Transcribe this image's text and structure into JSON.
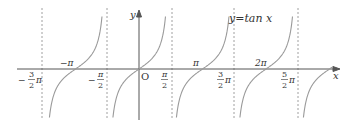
{
  "chart_data": {
    "type": "line",
    "title": "y=tan x",
    "function": "y = tan x",
    "xlabel": "x",
    "ylabel": "y",
    "origin_label": "O",
    "x_range_pi": [
      -2.0,
      3.0
    ],
    "asymptotes_pi": [
      -1.5,
      -0.5,
      0.5,
      1.5,
      2.5
    ],
    "zeros_pi": [
      -1,
      0,
      1,
      2,
      3
    ],
    "tick_labels": [
      {
        "value_pi": -1.5,
        "label": "-3/2 π"
      },
      {
        "value_pi": -1,
        "label": "-π"
      },
      {
        "value_pi": -0.5,
        "label": "-π/2"
      },
      {
        "value_pi": 0.5,
        "label": "π/2"
      },
      {
        "value_pi": 1,
        "label": "π"
      },
      {
        "value_pi": 1.5,
        "label": "3/2 π"
      },
      {
        "value_pi": 2,
        "label": "2π"
      },
      {
        "value_pi": 2.5,
        "label": "5/2 π"
      }
    ],
    "grid": false,
    "colors": {
      "curve": "#9a9a9a",
      "axis": "#555555",
      "asymptote": "#888888"
    }
  },
  "labels": {
    "func": "y=tan x",
    "y_axis": "y",
    "x_axis": "x",
    "origin": "O",
    "neg_pi": "−π",
    "pi": "π",
    "two_pi": "2π",
    "minus": "−",
    "pi_sym": "π",
    "three": "3",
    "two": "2",
    "five": "5"
  }
}
